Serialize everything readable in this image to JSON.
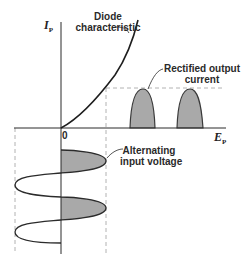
{
  "diagram": {
    "y_axis": {
      "symbol": "I",
      "subscript": "P"
    },
    "x_axis": {
      "symbol": "E",
      "subscript": "P"
    },
    "origin_label": "0",
    "annotations": {
      "diode_characteristic": [
        "Diode",
        "characteristic"
      ],
      "rectified_output": [
        "Rectified output",
        "current"
      ],
      "alternating_input": [
        "Alternating",
        "input voltage"
      ]
    },
    "colors": {
      "line": "#2b2b2b",
      "fill": "#a8a8a8",
      "dashed": "#9a9a9a"
    }
  }
}
